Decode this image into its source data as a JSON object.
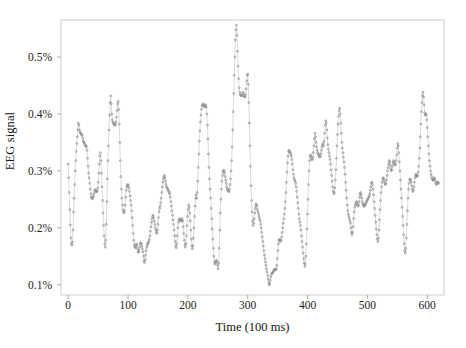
{
  "chart_data": {
    "type": "line",
    "title": "",
    "xlabel": "Time (100 ms)",
    "ylabel": "EEG signal",
    "grid": false,
    "legend": null,
    "marker": "circle",
    "marker_color": "#8a8a8a",
    "line_color": "#bdbdbd",
    "frame_color": "#c9c9c9",
    "xlim": [
      -12,
      628
    ],
    "ylim": [
      0.082,
      0.565
    ],
    "xticks": [
      0,
      100,
      200,
      300,
      400,
      500,
      600
    ],
    "xtick_labels": [
      "0",
      "100",
      "200",
      "300",
      "400",
      "500",
      "600"
    ],
    "yticks": [
      0.1,
      0.2,
      0.3,
      0.4,
      0.5
    ],
    "ytick_labels": [
      "0.1%",
      "0.2%",
      "0.3%",
      "0.4%",
      "0.5%"
    ],
    "x_units": "100 ms samples",
    "y_units": "percent",
    "n_points": 620,
    "x_start": 0,
    "x_step": 1,
    "series_name": "EEG signal",
    "values": [
      0.312,
      0.288,
      0.262,
      0.232,
      0.205,
      0.182,
      0.172,
      0.17,
      0.175,
      0.196,
      0.228,
      0.252,
      0.276,
      0.3,
      0.318,
      0.334,
      0.348,
      0.36,
      0.372,
      0.384,
      0.38,
      0.372,
      0.368,
      0.366,
      0.365,
      0.364,
      0.362,
      0.357,
      0.352,
      0.35,
      0.349,
      0.346,
      0.344,
      0.344,
      0.342,
      0.336,
      0.322,
      0.308,
      0.296,
      0.288,
      0.278,
      0.268,
      0.26,
      0.254,
      0.252,
      0.251,
      0.253,
      0.256,
      0.26,
      0.264,
      0.267,
      0.266,
      0.264,
      0.263,
      0.265,
      0.27,
      0.28,
      0.296,
      0.312,
      0.326,
      0.332,
      0.318,
      0.296,
      0.272,
      0.248,
      0.226,
      0.204,
      0.186,
      0.172,
      0.166,
      0.178,
      0.206,
      0.246,
      0.286,
      0.318,
      0.344,
      0.372,
      0.398,
      0.42,
      0.432,
      0.418,
      0.4,
      0.39,
      0.386,
      0.384,
      0.382,
      0.381,
      0.38,
      0.382,
      0.386,
      0.394,
      0.406,
      0.418,
      0.422,
      0.408,
      0.382,
      0.35,
      0.318,
      0.29,
      0.268,
      0.252,
      0.24,
      0.232,
      0.228,
      0.226,
      0.23,
      0.24,
      0.254,
      0.266,
      0.272,
      0.275,
      0.276,
      0.274,
      0.27,
      0.264,
      0.256,
      0.248,
      0.24,
      0.23,
      0.218,
      0.204,
      0.19,
      0.178,
      0.17,
      0.166,
      0.165,
      0.168,
      0.172,
      0.17,
      0.163,
      0.158,
      0.157,
      0.16,
      0.166,
      0.172,
      0.174,
      0.172,
      0.168,
      0.163,
      0.158,
      0.15,
      0.142,
      0.139,
      0.144,
      0.152,
      0.16,
      0.166,
      0.17,
      0.172,
      0.174,
      0.176,
      0.18,
      0.186,
      0.194,
      0.202,
      0.21,
      0.216,
      0.22,
      0.222,
      0.218,
      0.212,
      0.206,
      0.2,
      0.196,
      0.192,
      0.19,
      0.196,
      0.206,
      0.218,
      0.228,
      0.234,
      0.238,
      0.244,
      0.252,
      0.262,
      0.272,
      0.28,
      0.286,
      0.29,
      0.292,
      0.288,
      0.282,
      0.276,
      0.272,
      0.27,
      0.268,
      0.266,
      0.264,
      0.262,
      0.26,
      0.254,
      0.246,
      0.238,
      0.23,
      0.222,
      0.214,
      0.206,
      0.196,
      0.186,
      0.176,
      0.168,
      0.165,
      0.172,
      0.186,
      0.2,
      0.21,
      0.214,
      0.216,
      0.215,
      0.213,
      0.212,
      0.213,
      0.216,
      0.212,
      0.202,
      0.19,
      0.178,
      0.17,
      0.166,
      0.172,
      0.186,
      0.204,
      0.22,
      0.232,
      0.24,
      0.236,
      0.226,
      0.212,
      0.196,
      0.18,
      0.168,
      0.163,
      0.168,
      0.182,
      0.2,
      0.22,
      0.238,
      0.252,
      0.258,
      0.252,
      0.262,
      0.282,
      0.306,
      0.33,
      0.352,
      0.37,
      0.386,
      0.398,
      0.408,
      0.414,
      0.416,
      0.418,
      0.416,
      0.414,
      0.412,
      0.414,
      0.416,
      0.412,
      0.4,
      0.38,
      0.356,
      0.33,
      0.306,
      0.286,
      0.268,
      0.252,
      0.234,
      0.216,
      0.198,
      0.18,
      0.164,
      0.15,
      0.14,
      0.136,
      0.138,
      0.142,
      0.143,
      0.14,
      0.134,
      0.128,
      0.138,
      0.164,
      0.196,
      0.226,
      0.25,
      0.268,
      0.282,
      0.292,
      0.298,
      0.301,
      0.3,
      0.296,
      0.29,
      0.284,
      0.278,
      0.272,
      0.268,
      0.266,
      0.264,
      0.264,
      0.268,
      0.276,
      0.286,
      0.3,
      0.318,
      0.342,
      0.372,
      0.404,
      0.436,
      0.468,
      0.5,
      0.53,
      0.548,
      0.556,
      0.538,
      0.51,
      0.484,
      0.462,
      0.446,
      0.438,
      0.434,
      0.433,
      0.432,
      0.432,
      0.434,
      0.438,
      0.436,
      0.432,
      0.43,
      0.43,
      0.434,
      0.444,
      0.458,
      0.468,
      0.47,
      0.452,
      0.42,
      0.384,
      0.344,
      0.308,
      0.274,
      0.248,
      0.228,
      0.212,
      0.204,
      0.208,
      0.216,
      0.226,
      0.234,
      0.24,
      0.242,
      0.238,
      0.232,
      0.228,
      0.224,
      0.22,
      0.216,
      0.212,
      0.206,
      0.2,
      0.192,
      0.184,
      0.176,
      0.168,
      0.16,
      0.152,
      0.146,
      0.14,
      0.134,
      0.128,
      0.122,
      0.116,
      0.11,
      0.104,
      0.1,
      0.102,
      0.108,
      0.114,
      0.118,
      0.12,
      0.121,
      0.122,
      0.124,
      0.126,
      0.127,
      0.127,
      0.126,
      0.128,
      0.134,
      0.146,
      0.16,
      0.172,
      0.178,
      0.18,
      0.178,
      0.176,
      0.178,
      0.184,
      0.192,
      0.2,
      0.208,
      0.216,
      0.224,
      0.234,
      0.246,
      0.262,
      0.28,
      0.298,
      0.314,
      0.326,
      0.334,
      0.336,
      0.334,
      0.332,
      0.33,
      0.326,
      0.32,
      0.312,
      0.302,
      0.294,
      0.288,
      0.284,
      0.282,
      0.278,
      0.272,
      0.264,
      0.254,
      0.244,
      0.234,
      0.224,
      0.216,
      0.21,
      0.204,
      0.196,
      0.186,
      0.176,
      0.166,
      0.156,
      0.146,
      0.138,
      0.132,
      0.136,
      0.15,
      0.172,
      0.198,
      0.224,
      0.25,
      0.276,
      0.3,
      0.318,
      0.326,
      0.328,
      0.324,
      0.32,
      0.32,
      0.324,
      0.332,
      0.344,
      0.356,
      0.366,
      0.36,
      0.35,
      0.342,
      0.336,
      0.332,
      0.33,
      0.328,
      0.326,
      0.324,
      0.326,
      0.33,
      0.336,
      0.342,
      0.346,
      0.348,
      0.344,
      0.352,
      0.366,
      0.38,
      0.388,
      0.384,
      0.372,
      0.358,
      0.346,
      0.338,
      0.332,
      0.326,
      0.32,
      0.312,
      0.302,
      0.292,
      0.282,
      0.272,
      0.264,
      0.26,
      0.262,
      0.27,
      0.284,
      0.302,
      0.322,
      0.344,
      0.364,
      0.382,
      0.396,
      0.406,
      0.41,
      0.4,
      0.384,
      0.366,
      0.35,
      0.34,
      0.332,
      0.324,
      0.316,
      0.306,
      0.294,
      0.28,
      0.266,
      0.252,
      0.24,
      0.23,
      0.224,
      0.22,
      0.216,
      0.212,
      0.208,
      0.2,
      0.192,
      0.188,
      0.192,
      0.202,
      0.216,
      0.228,
      0.236,
      0.24,
      0.244,
      0.246,
      0.244,
      0.24,
      0.238,
      0.24,
      0.246,
      0.254,
      0.26,
      0.262,
      0.258,
      0.252,
      0.246,
      0.242,
      0.24,
      0.238,
      0.238,
      0.24,
      0.242,
      0.244,
      0.246,
      0.248,
      0.25,
      0.252,
      0.254,
      0.256,
      0.26,
      0.266,
      0.272,
      0.278,
      0.28,
      0.276,
      0.268,
      0.258,
      0.246,
      0.234,
      0.222,
      0.21,
      0.198,
      0.188,
      0.18,
      0.176,
      0.182,
      0.196,
      0.214,
      0.232,
      0.248,
      0.262,
      0.272,
      0.28,
      0.286,
      0.288,
      0.286,
      0.282,
      0.278,
      0.276,
      0.278,
      0.284,
      0.292,
      0.3,
      0.306,
      0.312,
      0.318,
      0.316,
      0.31,
      0.304,
      0.3,
      0.302,
      0.308,
      0.314,
      0.318,
      0.316,
      0.312,
      0.31,
      0.312,
      0.318,
      0.328,
      0.34,
      0.348,
      0.344,
      0.332,
      0.316,
      0.3,
      0.284,
      0.268,
      0.252,
      0.236,
      0.22,
      0.204,
      0.188,
      0.172,
      0.16,
      0.156,
      0.164,
      0.182,
      0.206,
      0.23,
      0.252,
      0.268,
      0.278,
      0.284,
      0.286,
      0.284,
      0.28,
      0.274,
      0.268,
      0.264,
      0.266,
      0.272,
      0.28,
      0.288,
      0.292,
      0.294,
      0.292,
      0.29,
      0.292,
      0.298,
      0.308,
      0.322,
      0.34,
      0.36,
      0.382,
      0.404,
      0.42,
      0.432,
      0.438,
      0.43,
      0.416,
      0.402,
      0.398,
      0.4,
      0.398,
      0.39,
      0.376,
      0.36,
      0.344,
      0.33,
      0.318,
      0.308,
      0.3,
      0.294,
      0.29,
      0.286,
      0.284,
      0.284,
      0.286,
      0.288,
      0.286,
      0.282,
      0.278,
      0.276,
      0.278,
      0.28,
      0.28,
      0.278
    ]
  },
  "axes": {
    "x_tick_labels": [
      "0",
      "100",
      "200",
      "300",
      "400",
      "500",
      "600"
    ],
    "y_tick_labels": [
      "0.1%",
      "0.2%",
      "0.3%",
      "0.4%",
      "0.5%"
    ],
    "x_title": "Time (100 ms)",
    "y_title": "EEG signal"
  }
}
